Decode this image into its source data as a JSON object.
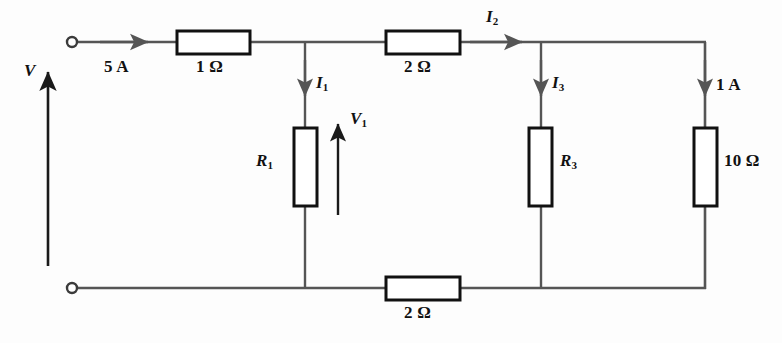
{
  "figure": {
    "type": "electrical-circuit-schematic",
    "background_color": "#fdfdfd",
    "wire_color": "#555555",
    "component_border_color": "#111111",
    "component_fill_color": "#ffffff",
    "text_color": "#111111"
  },
  "terminals": {
    "top_left": {
      "name": "input-terminal-positive",
      "x": 72,
      "y": 42
    },
    "bottom_left": {
      "name": "input-terminal-negative",
      "x": 72,
      "y": 288
    }
  },
  "source_label": {
    "symbol": "V",
    "arrow_direction": "up",
    "arrow_x": 48,
    "arrow_from_y": 266,
    "arrow_to_y": 68,
    "label_x": 26,
    "label_y": 64
  },
  "resistors": [
    {
      "id": "r-series-1ohm",
      "label": "1 Ω",
      "value": "1",
      "unit": "Ω",
      "orientation": "horizontal",
      "x": 177,
      "y": 31,
      "w": 73,
      "h": 23,
      "label_x": 195,
      "label_y": 62
    },
    {
      "id": "r-series-2ohm-top",
      "label": "2 Ω",
      "value": "2",
      "unit": "Ω",
      "orientation": "horizontal",
      "x": 386,
      "y": 31,
      "w": 74,
      "h": 23,
      "label_x": 404,
      "label_y": 62
    },
    {
      "id": "r-shunt-r1",
      "label": "R1",
      "value": "R",
      "unit": "",
      "orientation": "vertical",
      "x": 294,
      "y": 128,
      "w": 23,
      "h": 78,
      "label_x": 260,
      "label_y": 159
    },
    {
      "id": "r-shunt-r3",
      "label": "R3",
      "value": "R",
      "unit": "",
      "orientation": "vertical",
      "x": 529,
      "y": 128,
      "w": 23,
      "h": 78,
      "label_x": 562,
      "label_y": 159
    },
    {
      "id": "r-shunt-10ohm",
      "label": "10 Ω",
      "value": "10",
      "unit": "Ω",
      "orientation": "vertical",
      "x": 694,
      "y": 128,
      "w": 23,
      "h": 78,
      "label_x": 726,
      "label_y": 159
    },
    {
      "id": "r-series-2ohm-bottom",
      "label": "2 Ω",
      "value": "2",
      "unit": "Ω",
      "orientation": "horizontal",
      "x": 386,
      "y": 277,
      "w": 74,
      "h": 23,
      "label_x": 404,
      "label_y": 308
    }
  ],
  "currents": [
    {
      "id": "current-source-5a",
      "label": "5 A",
      "value": "5",
      "unit": "A",
      "direction": "right",
      "arrow_x1": 95,
      "arrow_y1": 42,
      "arrow_x2": 148,
      "arrow_y2": 42,
      "label_x": 106,
      "label_y": 60
    },
    {
      "id": "current-i1",
      "label": "I1",
      "symbol": "I",
      "subscript": "1",
      "direction": "down",
      "arrow_x1": 305,
      "arrow_y1": 58,
      "arrow_x2": 305,
      "arrow_y2": 96,
      "label_x": 316,
      "label_y": 76
    },
    {
      "id": "current-i2",
      "label": "I2",
      "symbol": "I",
      "subscript": "2",
      "direction": "right",
      "arrow_x1": 466,
      "arrow_y1": 42,
      "arrow_x2": 522,
      "arrow_y2": 42,
      "label_x": 487,
      "label_y": 10
    },
    {
      "id": "current-i3",
      "label": "I3",
      "symbol": "I",
      "subscript": "3",
      "direction": "down",
      "arrow_x1": 541,
      "arrow_y1": 58,
      "arrow_x2": 541,
      "arrow_y2": 96,
      "label_x": 552,
      "label_y": 76
    },
    {
      "id": "current-1a",
      "label": "1 A",
      "value": "1",
      "unit": "A",
      "direction": "down",
      "arrow_x1": 705,
      "arrow_y1": 58,
      "arrow_x2": 705,
      "arrow_y2": 96,
      "label_x": 716,
      "label_y": 78
    }
  ],
  "voltages": [
    {
      "id": "voltage-v1",
      "label": "V1",
      "symbol": "V",
      "subscript": "1",
      "direction": "up",
      "arrow_x": 338,
      "arrow_from_y": 215,
      "arrow_to_y": 120,
      "label_x": 348,
      "label_y": 116
    }
  ],
  "nodes": [
    {
      "id": "node-a",
      "x": 305,
      "y": 42
    },
    {
      "id": "node-b",
      "x": 541,
      "y": 42
    },
    {
      "id": "node-c",
      "x": 305,
      "y": 288
    },
    {
      "id": "node-d",
      "x": 541,
      "y": 288
    }
  ]
}
